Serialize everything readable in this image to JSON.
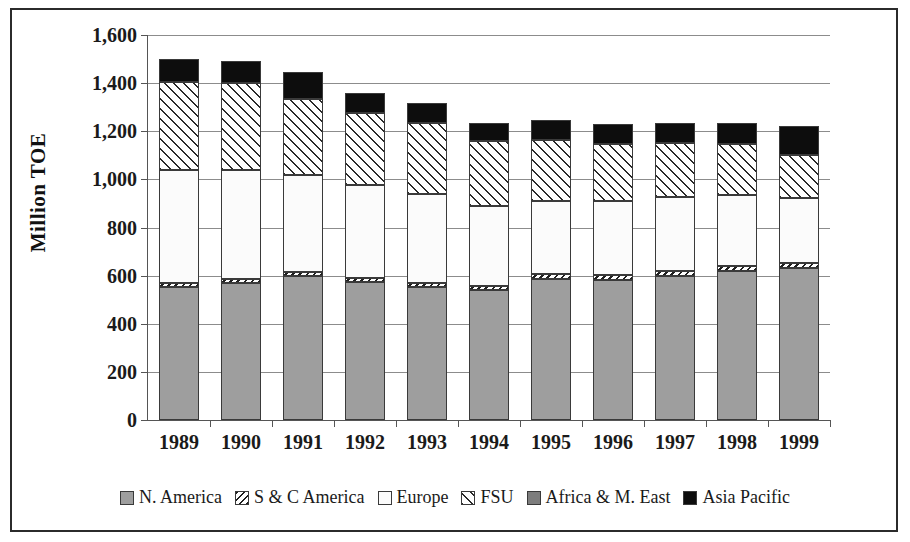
{
  "chart_data": {
    "type": "bar",
    "subtype": "stacked-bar",
    "title": "",
    "xlabel": "",
    "ylabel": "Million TOE",
    "ylim": [
      0,
      1600
    ],
    "ytick_step": 200,
    "ytick_labels": [
      "1,600",
      "1,400",
      "1,200",
      "1,000",
      "800",
      "600",
      "400",
      "200",
      "0"
    ],
    "ytick_values": [
      1600,
      1400,
      1200,
      1000,
      800,
      600,
      400,
      200,
      0
    ],
    "grid": true,
    "legend_position": "bottom",
    "categories": [
      "1989",
      "1990",
      "1991",
      "1992",
      "1993",
      "1994",
      "1995",
      "1996",
      "1997",
      "1998",
      "1999"
    ],
    "series": [
      {
        "name": "N. America",
        "pattern": "gray-stipple",
        "color": "#9e9e9e",
        "values": [
          553,
          570,
          597,
          573,
          553,
          540,
          587,
          583,
          600,
          620,
          630
        ]
      },
      {
        "name": "S & C America",
        "pattern": "dense-diagonal-hatch",
        "color": "#1f1f1f",
        "values": [
          18,
          17,
          17,
          17,
          18,
          18,
          18,
          20,
          20,
          22,
          24
        ]
      },
      {
        "name": "Europe",
        "pattern": "light-stipple",
        "color": "#fbfbfb",
        "values": [
          468,
          452,
          405,
          387,
          370,
          330,
          305,
          307,
          305,
          293,
          267
        ]
      },
      {
        "name": "FSU",
        "pattern": "diagonal-hatch",
        "color": "#ffffff",
        "values": [
          366,
          362,
          317,
          298,
          293,
          272,
          255,
          235,
          225,
          210,
          180
        ]
      },
      {
        "name": "Africa & M. East",
        "pattern": "dark-gray-stipple",
        "color": "#7d7d7d",
        "values": [
          0,
          0,
          0,
          0,
          0,
          0,
          0,
          0,
          0,
          0,
          0
        ]
      },
      {
        "name": "Asia Pacific",
        "pattern": "solid-black",
        "color": "#0d0d0d",
        "values": [
          95,
          90,
          110,
          85,
          85,
          75,
          80,
          85,
          85,
          90,
          120
        ]
      }
    ],
    "totals": [
      1500,
      1491,
      1446,
      1360,
      1319,
      1235,
      1245,
      1230,
      1235,
      1235,
      1221
    ]
  },
  "legend": {
    "items": [
      {
        "label": "N. America"
      },
      {
        "label": "S & C America"
      },
      {
        "label": "Europe"
      },
      {
        "label": "FSU"
      },
      {
        "label": "Africa & M. East"
      },
      {
        "label": "Asia Pacific"
      }
    ]
  }
}
